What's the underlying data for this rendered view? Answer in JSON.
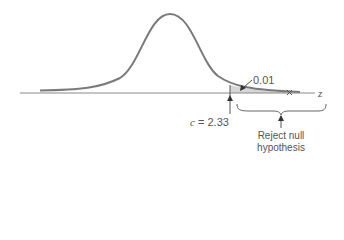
{
  "diagram": {
    "type": "normal-distribution-hypothesis-test",
    "axis_label": "z",
    "tail_area_label": "0.01",
    "critical_value": {
      "variable": "c",
      "equals": "=",
      "value": "2.33"
    },
    "rejection_region_label": {
      "line1": "Reject null",
      "line2": "hypothesis"
    },
    "colors": {
      "curve": "#7a7a7a",
      "axis": "#8a8a8a",
      "shade": "#d6d6d6",
      "text": "#555555",
      "arrow": "#333333"
    }
  }
}
